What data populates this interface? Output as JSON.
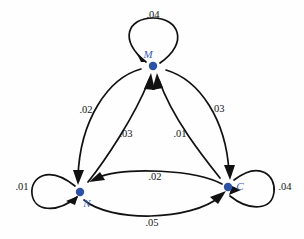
{
  "diagram": {
    "type": "directed-graph",
    "title": "",
    "background_color": "#fefefe",
    "node_color": "#2b52a8",
    "node_label_color": "#3a5fbf",
    "edge_color": "#111111",
    "nodes": [
      {
        "id": "M",
        "label": "M",
        "x": 153,
        "y": 66
      },
      {
        "id": "N",
        "label": "N",
        "x": 80,
        "y": 192
      },
      {
        "id": "C",
        "label": "C",
        "x": 228,
        "y": 187
      }
    ],
    "edges": [
      {
        "id": "m-self",
        "from": "M",
        "to": "M",
        "label": ".04",
        "label_x": 153,
        "label_y": 18
      },
      {
        "id": "n-self",
        "from": "N",
        "to": "N",
        "label": ".01",
        "label_x": 22,
        "label_y": 190
      },
      {
        "id": "c-self",
        "from": "C",
        "to": "C",
        "label": ".04",
        "label_x": 285,
        "label_y": 190
      },
      {
        "id": "m-to-n",
        "from": "M",
        "to": "N",
        "label": ".02",
        "label_x": 86,
        "label_y": 113
      },
      {
        "id": "m-to-c",
        "from": "M",
        "to": "C",
        "label": ".03",
        "label_x": 218,
        "label_y": 112
      },
      {
        "id": "n-to-m",
        "from": "N",
        "to": "M",
        "label": ".03",
        "label_x": 126,
        "label_y": 137
      },
      {
        "id": "c-to-m",
        "from": "C",
        "to": "M",
        "label": ".01",
        "label_x": 180,
        "label_y": 137
      },
      {
        "id": "c-to-n",
        "from": "C",
        "to": "N",
        "label": ".02",
        "label_x": 155,
        "label_y": 180
      },
      {
        "id": "n-to-c",
        "from": "N",
        "to": "C",
        "label": ".05",
        "label_x": 152,
        "label_y": 226
      }
    ]
  }
}
